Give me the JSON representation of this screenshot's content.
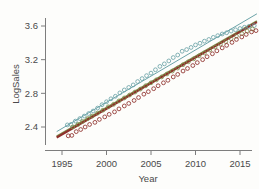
{
  "chart_data": {
    "type": "scatter",
    "title": "",
    "subtitle": "",
    "xlabel": "Year",
    "ylabel": "LogSales",
    "xlim": [
      1994.2,
      2017.2
    ],
    "ylim": [
      2.24,
      3.78
    ],
    "grid": false,
    "legend": "none",
    "xticks": [
      1995,
      2000,
      2005,
      2010,
      2015
    ],
    "xtick_labels": [
      "1995",
      "2000",
      "2005",
      "2010",
      "2015"
    ],
    "yticks": [
      2.4,
      2.8,
      3.2,
      3.6
    ],
    "ytick_labels": [
      "2.4",
      "2.8",
      "3.2",
      "3.6"
    ],
    "marker": "open-circle",
    "colors": {
      "teal": "#6ba3a8",
      "olive": "#7f8f4e",
      "red": "#8e2f2a",
      "axis": "#7d7d7d",
      "text": "#4a4a4a",
      "background": "#fdfdfb"
    },
    "series": [
      {
        "name": "teal",
        "color": "#6ba3a8",
        "fit": {
          "x": [
            1994.4,
            2016.9
          ],
          "y": [
            2.345,
            3.745
          ],
          "width": 1.0
        },
        "x": [
          1995.6,
          1996.0,
          1996.5,
          1997.0,
          1997.5,
          1998.0,
          1998.5,
          1999.0,
          1999.5,
          2000.0,
          2000.5,
          2001.0,
          2001.5,
          2002.0,
          2002.5,
          2003.0,
          2003.5,
          2004.0,
          2004.5,
          2005.0,
          2005.5,
          2006.0,
          2006.5,
          2007.0,
          2007.5,
          2008.0,
          2008.5,
          2009.0,
          2009.5,
          2010.0,
          2010.5,
          2011.0,
          2011.5,
          2012.0,
          2012.5,
          2013.0,
          2013.5,
          2014.0,
          2014.5,
          2015.0,
          2015.5,
          2016.0,
          2016.6
        ],
        "y": [
          2.425,
          2.43,
          2.47,
          2.5,
          2.53,
          2.56,
          2.59,
          2.625,
          2.665,
          2.7,
          2.735,
          2.765,
          2.805,
          2.84,
          2.87,
          2.9,
          2.94,
          2.975,
          3.01,
          3.04,
          3.08,
          3.12,
          3.15,
          3.185,
          3.225,
          3.255,
          3.3,
          3.32,
          3.345,
          3.375,
          3.395,
          3.42,
          3.44,
          3.465,
          3.485,
          3.505,
          3.52,
          3.54,
          3.555,
          3.57,
          3.585,
          3.595,
          3.605
        ]
      },
      {
        "name": "olive",
        "color": "#7f8f4e",
        "fit": {
          "x": [
            1994.4,
            2016.9
          ],
          "y": [
            2.29,
            3.66
          ],
          "width": 1.6
        },
        "x": [
          1996.2,
          1996.8,
          1997.3,
          1997.9,
          1998.4,
          1999.0,
          1999.6,
          2000.2,
          2000.8,
          2001.4,
          2002.0,
          2002.6,
          2003.2,
          2003.8,
          2004.4,
          2005.0,
          2005.6,
          2006.2,
          2006.8,
          2007.4,
          2008.0,
          2008.6,
          2009.2,
          2009.8,
          2010.4,
          2011.0,
          2011.6,
          2012.2,
          2012.8,
          2013.4,
          2014.0,
          2014.6,
          2015.2,
          2015.8,
          2016.4
        ],
        "y": [
          2.4,
          2.43,
          2.465,
          2.5,
          2.53,
          2.565,
          2.6,
          2.64,
          2.67,
          2.71,
          2.745,
          2.78,
          2.815,
          2.85,
          2.89,
          2.925,
          2.96,
          2.995,
          3.03,
          3.065,
          3.1,
          3.14,
          3.175,
          3.21,
          3.245,
          3.28,
          3.315,
          3.35,
          3.385,
          3.415,
          3.45,
          3.48,
          3.51,
          3.54,
          3.565
        ]
      },
      {
        "name": "red",
        "color": "#8e2f2a",
        "fit": {
          "x": [
            1994.4,
            2016.9
          ],
          "y": [
            2.275,
            3.645
          ],
          "width": 2.1
        },
        "x": [
          1995.7,
          1996.1,
          1996.6,
          1997.1,
          1997.6,
          1998.1,
          1998.7,
          1999.2,
          1999.8,
          2000.3,
          2000.9,
          2001.4,
          2002.0,
          2002.5,
          2003.1,
          2003.6,
          2004.2,
          2004.7,
          2005.3,
          2005.8,
          2006.4,
          2006.9,
          2007.5,
          2008.0,
          2008.6,
          2009.1,
          2009.7,
          2010.2,
          2010.8,
          2011.3,
          2011.9,
          2012.4,
          2013.0,
          2013.5,
          2014.1,
          2014.6,
          2015.2,
          2015.7,
          2016.3,
          2016.8
        ],
        "y": [
          2.295,
          2.3,
          2.345,
          2.37,
          2.4,
          2.43,
          2.455,
          2.49,
          2.52,
          2.55,
          2.58,
          2.615,
          2.65,
          2.68,
          2.715,
          2.75,
          2.79,
          2.82,
          2.855,
          2.89,
          2.925,
          2.955,
          2.995,
          3.025,
          3.065,
          3.095,
          3.13,
          3.165,
          3.2,
          3.235,
          3.27,
          3.305,
          3.34,
          3.37,
          3.405,
          3.44,
          3.47,
          3.5,
          3.53,
          3.545
        ]
      }
    ]
  },
  "axes": {
    "ylabel": "LogSales",
    "xlabel": "Year",
    "ytick_labels": [
      "3.6",
      "3.2",
      "2.8",
      "2.4"
    ],
    "xtick_labels": [
      "1995",
      "2000",
      "2005",
      "2010",
      "2015"
    ]
  }
}
